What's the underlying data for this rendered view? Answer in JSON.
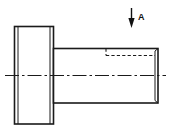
{
  "drawing": {
    "title": "Stepped shaft with flange head - side elevation",
    "type": "engineering-orthographic-view",
    "canvas": {
      "width": 169,
      "height": 135,
      "background": "#ffffff"
    },
    "line_colors": {
      "outline": "#1a1a1a",
      "hidden": "#1a1a1a",
      "centerline": "#1a1a1a",
      "arrow": "#111111"
    },
    "annotations": {
      "section_arrow": {
        "icon": "down-arrow-icon",
        "label": "A",
        "direction": "down",
        "x": 131,
        "y_top": 8,
        "y_tip": 28
      }
    },
    "geometry": {
      "flange": {
        "name": "flange-head",
        "left": 14,
        "right": 54,
        "top": 26,
        "bottom": 124,
        "inner_face_x": 50,
        "edge_band_x": 17
      },
      "shaft": {
        "name": "cylindrical-shaft",
        "left": 54,
        "right": 158,
        "top": 48,
        "bottom": 103,
        "chamfer_x": 155,
        "edge_band_y_top": 51,
        "edge_band_y_bottom": 100
      },
      "hidden_detail": {
        "name": "hidden-bore-edge",
        "vertical_x": 106,
        "vertical_y_top": 48,
        "vertical_y_bottom": 55,
        "horizontal_y": 55,
        "horizontal_x_start": 106,
        "horizontal_x_end": 155
      },
      "centerline": {
        "name": "axis-centerline",
        "y": 75,
        "x_start": 5,
        "x_end": 166
      }
    }
  }
}
